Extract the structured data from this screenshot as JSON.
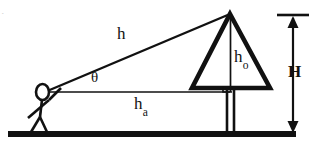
{
  "figure": {
    "background_color": "#ffffff",
    "ink_color": "#111111",
    "width": 310,
    "height": 148,
    "labels": {
      "hypotenuse": "h",
      "angle": "θ",
      "adjacent_base": "h",
      "adjacent_base_subscript": "a",
      "object_height": "h",
      "object_height_subscript": "o",
      "total_height": "H",
      "corner_mark": "⋅"
    },
    "elements": {
      "observer": "stick-figure-observer",
      "eye": "observer-eye-oval",
      "ground": "ground-line",
      "tree": "triangular-tree-canopy",
      "trunk": "tree-trunk",
      "sight_line": "line-of-sight-hypotenuse",
      "horizontal_line": "horizontal-eye-level-line",
      "vertical_object_line": "object-height-vertical-line",
      "right_angle": "right-angle-marker",
      "dimension": "total-height-dimension-arrow"
    },
    "geometry": {
      "apex": [
        230,
        14
      ],
      "eye": [
        48,
        91
      ],
      "base_left": [
        192,
        88
      ],
      "base_right": [
        270,
        88
      ],
      "ground_y": 134,
      "dimension_x": 293
    }
  }
}
